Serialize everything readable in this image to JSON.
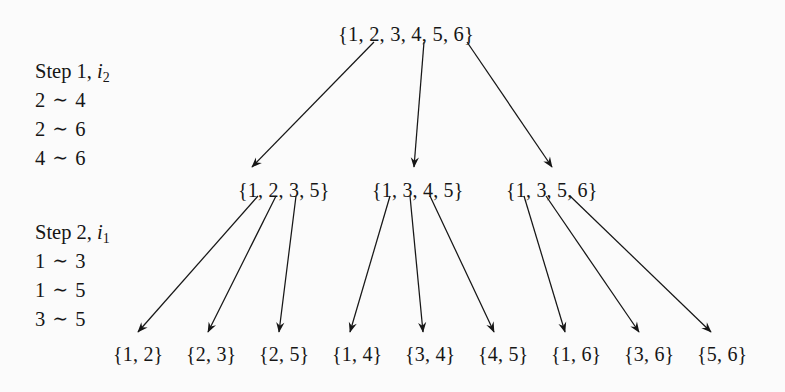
{
  "figure": {
    "background_color": "#fbfbfb",
    "ink_color": "#161616",
    "relation_symbol": "∼"
  },
  "steps": [
    {
      "title_prefix": "Step 1, ",
      "title_index_letter": "i",
      "title_index_sub": "2",
      "relations": [
        {
          "left": "2",
          "symbol": "∼",
          "right": "4"
        },
        {
          "left": "2",
          "symbol": "∼",
          "right": "6"
        },
        {
          "left": "4",
          "symbol": "∼",
          "right": "6"
        }
      ]
    },
    {
      "title_prefix": "Step 2, ",
      "title_index_letter": "i",
      "title_index_sub": "1",
      "relations": [
        {
          "left": "1",
          "symbol": "∼",
          "right": "3"
        },
        {
          "left": "1",
          "symbol": "∼",
          "right": "5"
        },
        {
          "left": "3",
          "symbol": "∼",
          "right": "5"
        }
      ]
    }
  ],
  "tree": {
    "root": {
      "label": "{1, 2, 3, 4, 5, 6}",
      "x": 338,
      "y": 24
    },
    "level2": [
      {
        "label": "{1, 2, 3, 5}",
        "x": 238,
        "y": 180
      },
      {
        "label": "{1, 3, 4, 5}",
        "x": 372,
        "y": 180
      },
      {
        "label": "{1, 3, 5, 6}",
        "x": 506,
        "y": 180
      }
    ],
    "level3": [
      {
        "label": "{1, 2}",
        "x": 113,
        "y": 344
      },
      {
        "label": "{2, 3}",
        "x": 186,
        "y": 344
      },
      {
        "label": "{2, 5}",
        "x": 259,
        "y": 344
      },
      {
        "label": "{1, 4}",
        "x": 332,
        "y": 344
      },
      {
        "label": "{3, 4}",
        "x": 405,
        "y": 344
      },
      {
        "label": "{4, 5}",
        "x": 478,
        "y": 344
      },
      {
        "label": "{1, 6}",
        "x": 551,
        "y": 344
      },
      {
        "label": "{3, 6}",
        "x": 624,
        "y": 344
      },
      {
        "label": "{5, 6}",
        "x": 697,
        "y": 344
      }
    ],
    "edges_level1": [
      {
        "x1": 374,
        "y1": 42,
        "x2": 252,
        "y2": 167
      },
      {
        "x1": 424,
        "y1": 42,
        "x2": 414,
        "y2": 167
      },
      {
        "x1": 467,
        "y1": 42,
        "x2": 552,
        "y2": 167
      }
    ],
    "edges_level2": [
      {
        "x1": 258,
        "y1": 196,
        "x2": 138,
        "y2": 332
      },
      {
        "x1": 276,
        "y1": 196,
        "x2": 208,
        "y2": 332
      },
      {
        "x1": 296,
        "y1": 196,
        "x2": 279,
        "y2": 332
      },
      {
        "x1": 390,
        "y1": 196,
        "x2": 350,
        "y2": 332
      },
      {
        "x1": 410,
        "y1": 196,
        "x2": 423,
        "y2": 332
      },
      {
        "x1": 430,
        "y1": 196,
        "x2": 494,
        "y2": 332
      },
      {
        "x1": 524,
        "y1": 196,
        "x2": 565,
        "y2": 332
      },
      {
        "x1": 546,
        "y1": 196,
        "x2": 639,
        "y2": 332
      },
      {
        "x1": 570,
        "y1": 196,
        "x2": 711,
        "y2": 332
      }
    ]
  },
  "layout": {
    "step1_x": 35,
    "step1_y": 57,
    "step2_x": 35,
    "step2_y": 218
  }
}
